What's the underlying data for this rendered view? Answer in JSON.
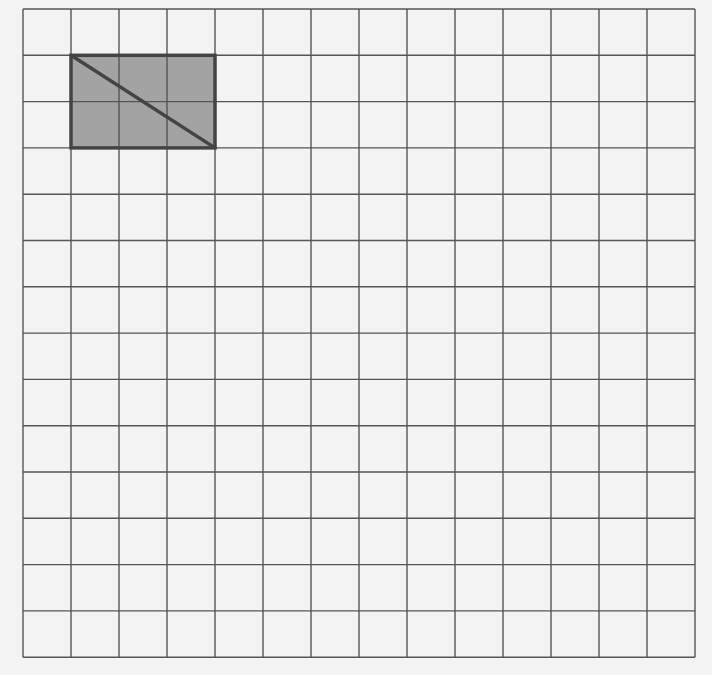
{
  "diagram": {
    "type": "grid-figure",
    "grid": {
      "columns": 14,
      "rows": 14,
      "origin_x": 23,
      "origin_y": 9,
      "cell_width": 48,
      "cell_height": 46.3,
      "line_color": "#555555",
      "background_color": "#f3f3f3"
    },
    "shapes": [
      {
        "kind": "rectangle",
        "name": "shaded-rectangle",
        "col_start": 1,
        "row_start": 1,
        "width_cells": 3,
        "height_cells": 2,
        "fill_color": "#a3a3a3",
        "stroke_color": "#444444"
      },
      {
        "kind": "diagonal",
        "name": "rectangle-diagonal",
        "from": {
          "col": 1,
          "row": 1
        },
        "to": {
          "col": 4,
          "row": 3
        },
        "stroke_color": "#444444"
      }
    ]
  }
}
